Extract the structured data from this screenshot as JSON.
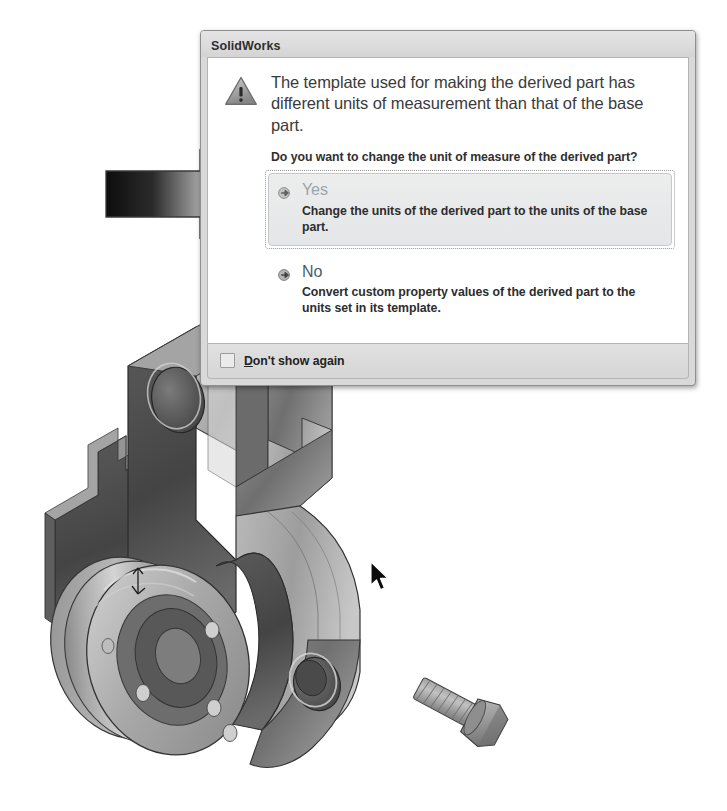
{
  "dialog": {
    "title": "SolidWorks",
    "warning_icon": "warning-triangle-icon",
    "main_instruction": "The template used for making the derived part has different units of measurement than that of the base part.",
    "sub_question": "Do you want to change the unit of measure of the derived part?",
    "command_links": [
      {
        "id": "yes",
        "bullet_icon": "arrow-bullet-icon",
        "title": "Yes",
        "description": "Change the units of the derived part to the units of the base part.",
        "state": "hovered"
      },
      {
        "id": "no",
        "bullet_icon": "arrow-bullet-icon",
        "title": "No",
        "description": "Convert custom property values of the derived part to the units set in its template.",
        "state": "normal"
      }
    ],
    "footer": {
      "checkbox_icon": "checkbox-unchecked-icon",
      "checkbox_checked": false,
      "checkbox_accel": "D",
      "checkbox_label_rest": "on't show again",
      "checkbox_label_full": "Don't show again"
    },
    "colors": {
      "title_bar": "#dcdcdc",
      "body_background": "#ffffff",
      "footer_background": "#d9d9d9",
      "border": "#8f8f8f",
      "link_text": "#4a5b6b",
      "link_text_hovered": "#9aa3ac"
    }
  },
  "annotation": {
    "arrow_icon": "right-pointing-block-arrow-icon",
    "arrow_gradient_from": "#0d0d0d",
    "arrow_gradient_to": "#e8e8e8",
    "points_to": "yes"
  },
  "cursor": {
    "icon": "mouse-pointer-icon",
    "x": 375,
    "y": 570
  },
  "viewport": {
    "model_name": "derived-part-bracket-assembly",
    "background": "#ffffff",
    "parts": [
      {
        "name": "bracket-body",
        "icon": "cad-solid-icon"
      },
      {
        "name": "circular-flange-with-bolt-holes",
        "icon": "cad-solid-icon"
      },
      {
        "name": "hex-head-bolt",
        "icon": "cad-fastener-icon"
      },
      {
        "name": "origin-triad",
        "icon": "coordinate-triad-icon"
      }
    ]
  }
}
